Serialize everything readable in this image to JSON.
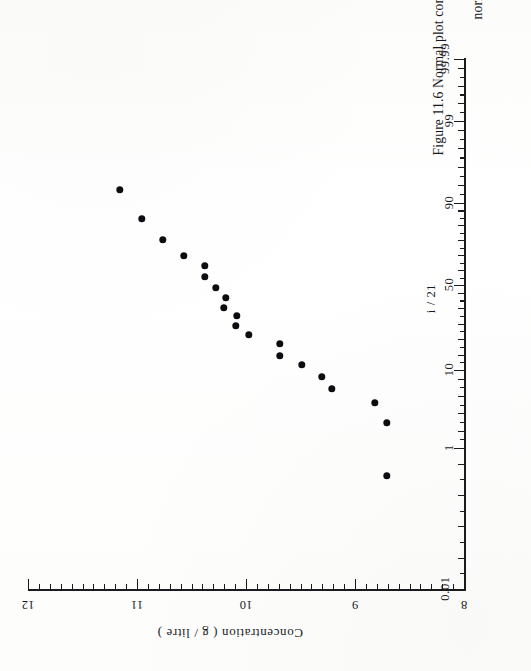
{
  "figure": {
    "caption_line1": "Figure 11.6 Normal plot concentrations (g/litre) (given in Chapter 13.3.1) using",
    "caption_line2": "normal probability paper"
  },
  "chart_data": {
    "type": "scatter",
    "title": "Figure 11.6 Normal plot concentrations (g/litre) (given in Chapter 13.3.1) using normal probability paper",
    "subtitle": "",
    "orientation": "rotated-90-clockwise",
    "grid": false,
    "legend": null,
    "xlabel": "",
    "x_axis_name": "cumulative percentage (normal probability scale)",
    "x_tick_labels": [
      "0.01",
      "1",
      "10",
      "50",
      "90",
      "99",
      "99.99"
    ],
    "x_tick_values": [
      0.01,
      1,
      10,
      50,
      90,
      99,
      99.99
    ],
    "x_extra_annotation": "i / 21",
    "ylabel": "Concentration ( g / litre )",
    "y_tick_labels": [
      "8",
      "9",
      "10",
      "11",
      "12"
    ],
    "y_tick_values": [
      8,
      9,
      10,
      11,
      12
    ],
    "ylim": [
      8,
      12
    ],
    "n_points": 20,
    "points": [
      {
        "p": 95.2,
        "value": 11.27
      },
      {
        "p": 90.5,
        "value": 10.99
      },
      {
        "p": 85.7,
        "value": 10.79
      },
      {
        "p": 81.0,
        "value": 10.65
      },
      {
        "p": 76.2,
        "value": 10.53
      },
      {
        "p": 71.4,
        "value": 10.41
      },
      {
        "p": 66.7,
        "value": 10.31
      },
      {
        "p": 61.9,
        "value": 10.22
      },
      {
        "p": 57.1,
        "value": 10.14
      },
      {
        "p": 52.4,
        "value": 10.03
      },
      {
        "p": 47.6,
        "value": 9.95
      },
      {
        "p": 42.9,
        "value": 9.84
      },
      {
        "p": 38.1,
        "value": 9.56
      },
      {
        "p": 33.3,
        "value": 9.46
      },
      {
        "p": 28.6,
        "value": 9.27
      },
      {
        "p": 23.8,
        "value": 9.09
      },
      {
        "p": 19.0,
        "value": 8.91
      },
      {
        "p": 14.3,
        "value": 8.72
      },
      {
        "p": 9.5,
        "value": 8.33
      },
      {
        "p": 4.8,
        "value": 8.16
      }
    ],
    "pixel_points": [
      {
        "x": 120,
        "y": 190
      },
      {
        "x": 142,
        "y": 219
      },
      {
        "x": 163,
        "y": 240
      },
      {
        "x": 184,
        "y": 256
      },
      {
        "x": 205,
        "y": 266
      },
      {
        "x": 205,
        "y": 277
      },
      {
        "x": 216,
        "y": 288
      },
      {
        "x": 226,
        "y": 298
      },
      {
        "x": 224,
        "y": 308
      },
      {
        "x": 237,
        "y": 316
      },
      {
        "x": 236,
        "y": 326
      },
      {
        "x": 249,
        "y": 335
      },
      {
        "x": 280,
        "y": 344
      },
      {
        "x": 280,
        "y": 356
      },
      {
        "x": 302,
        "y": 365
      },
      {
        "x": 322,
        "y": 377
      },
      {
        "x": 332,
        "y": 389
      },
      {
        "x": 375,
        "y": 403
      },
      {
        "x": 387,
        "y": 423
      },
      {
        "x": 387,
        "y": 476
      }
    ]
  },
  "axes": {
    "concentration": {
      "title": "Concentration ( g / litre )",
      "major": [
        {
          "label": "12",
          "x": 28
        },
        {
          "label": "11",
          "x": 137
        },
        {
          "label": "10",
          "x": 246
        },
        {
          "label": "9",
          "x": 355
        },
        {
          "label": "8",
          "x": 464
        }
      ]
    },
    "probability": {
      "annotation": "i / 21",
      "major": [
        {
          "label": "0.01",
          "y": 589
        },
        {
          "label": "1",
          "y": 448
        },
        {
          "label": "10",
          "y": 370
        },
        {
          "label": "50",
          "y": 285
        },
        {
          "label": "90",
          "y": 203
        },
        {
          "label": "99",
          "y": 121
        },
        {
          "label": "99.99",
          "y": 59
        }
      ]
    }
  }
}
